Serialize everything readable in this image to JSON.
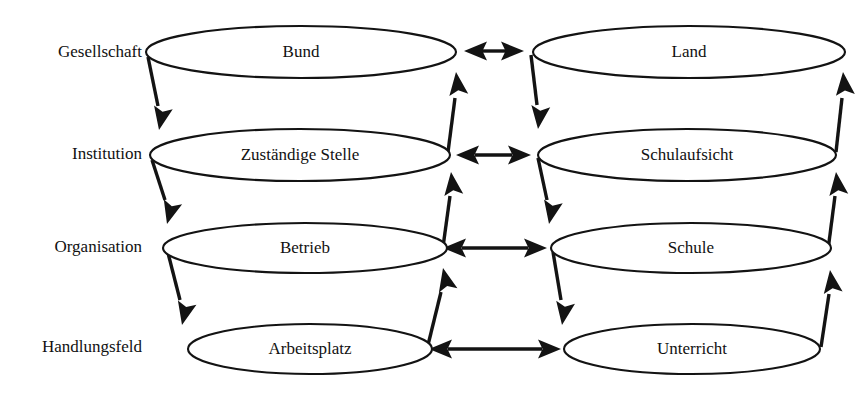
{
  "diagram": {
    "background_color": "#ffffff",
    "line_color": "#131313",
    "text_color": "#111111",
    "levels": [
      {
        "id": "gesellschaft",
        "label": "Gesellschaft"
      },
      {
        "id": "institution",
        "label": "Institution"
      },
      {
        "id": "organisation",
        "label": "Organisation"
      },
      {
        "id": "handlungsfeld",
        "label": "Handlungsfeld"
      }
    ],
    "columns": [
      {
        "id": "betrieb-seite",
        "nodes": [
          "Bund",
          "Zuständige Stelle",
          "Betrieb",
          "Arbeitsplatz"
        ]
      },
      {
        "id": "schule-seite",
        "nodes": [
          "Land",
          "Schulaufsicht",
          "Schule",
          "Unterricht"
        ]
      }
    ],
    "nodes": {
      "left": [
        {
          "id": "bund",
          "label": "Bund",
          "level": "Gesellschaft"
        },
        {
          "id": "zustaendige-stelle",
          "label": "Zuständige Stelle",
          "level": "Institution"
        },
        {
          "id": "betrieb",
          "label": "Betrieb",
          "level": "Organisation"
        },
        {
          "id": "arbeitsplatz",
          "label": "Arbeitsplatz",
          "level": "Handlungsfeld"
        }
      ],
      "right": [
        {
          "id": "land",
          "label": "Land",
          "level": "Gesellschaft"
        },
        {
          "id": "schulaufsicht",
          "label": "Schulaufsicht",
          "level": "Institution"
        },
        {
          "id": "schule",
          "label": "Schule",
          "level": "Organisation"
        },
        {
          "id": "unterricht",
          "label": "Unterricht",
          "level": "Handlungsfeld"
        }
      ]
    },
    "connections": {
      "horizontal_pairs": [
        {
          "from": "Bund",
          "to": "Land",
          "style": "double-arrow"
        },
        {
          "from": "Zuständige Stelle",
          "to": "Schulaufsicht",
          "style": "double-arrow"
        },
        {
          "from": "Betrieb",
          "to": "Schule",
          "style": "double-arrow"
        },
        {
          "from": "Arbeitsplatz",
          "to": "Unterricht",
          "style": "double-arrow"
        }
      ],
      "downward": [
        {
          "from": "Bund",
          "to": "Zuständige Stelle"
        },
        {
          "from": "Zuständige Stelle",
          "to": "Betrieb"
        },
        {
          "from": "Betrieb",
          "to": "Arbeitsplatz"
        },
        {
          "from": "Land",
          "to": "Schulaufsicht"
        },
        {
          "from": "Schulaufsicht",
          "to": "Schule"
        },
        {
          "from": "Schule",
          "to": "Unterricht"
        }
      ],
      "upward": [
        {
          "from": "Zuständige Stelle",
          "to": "Bund"
        },
        {
          "from": "Betrieb",
          "to": "Zuständige Stelle"
        },
        {
          "from": "Arbeitsplatz",
          "to": "Betrieb"
        },
        {
          "from": "Schulaufsicht",
          "to": "Land"
        },
        {
          "from": "Schule",
          "to": "Schulaufsicht"
        },
        {
          "from": "Unterricht",
          "to": "Schule"
        }
      ]
    }
  }
}
